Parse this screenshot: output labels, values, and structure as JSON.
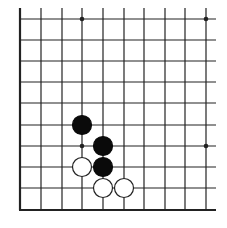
{
  "board": {
    "description": "Go board corner fragment (lower-left corner), 10 columns x 10 rows visible",
    "columns_x": [
      20,
      41,
      62,
      82,
      103,
      124,
      144,
      165,
      185,
      206
    ],
    "rows_y": [
      19,
      40,
      61,
      82,
      103,
      125,
      146,
      167,
      188,
      210
    ],
    "right_edge_x": 216,
    "top_edge_y": 8,
    "line_color": "#222222",
    "edge_line_width": 2.2,
    "line_width": 1.2,
    "stone_radius": 9.5,
    "star_radius": 2.3,
    "star_points": [
      {
        "col": 3,
        "row": 0
      },
      {
        "col": 9,
        "row": 0
      },
      {
        "col": 3,
        "row": 6
      },
      {
        "col": 9,
        "row": 6
      }
    ],
    "stones": [
      {
        "color": "black",
        "col": 3,
        "row": 5
      },
      {
        "color": "black",
        "col": 4,
        "row": 6
      },
      {
        "color": "black",
        "col": 4,
        "row": 7
      },
      {
        "color": "white",
        "col": 3,
        "row": 7
      },
      {
        "color": "white",
        "col": 4,
        "row": 8
      },
      {
        "color": "white",
        "col": 5,
        "row": 8
      }
    ],
    "colors": {
      "black_stone": "#0a0a0a",
      "white_stone": "#ffffff",
      "white_stone_border": "#222222",
      "background": "#ffffff"
    }
  }
}
